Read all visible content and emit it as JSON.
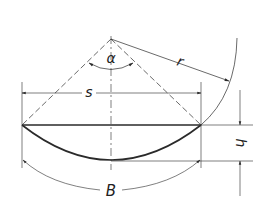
{
  "diagram": {
    "type": "circular-segment-geometry",
    "labels": {
      "angle": "α",
      "radius": "r",
      "chord": "s",
      "height": "h",
      "arc_length": "B"
    },
    "colors": {
      "line": "#2a2a2a",
      "background": "#ffffff"
    }
  }
}
